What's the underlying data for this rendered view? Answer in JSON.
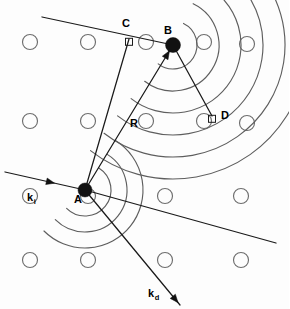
{
  "figure": {
    "kind": "scattering-path-difference-diagram",
    "width": 289,
    "height": 309,
    "background_color": "#fdfdfd",
    "ink_color": "#1a1a1a",
    "arc_color": "#5e5e5e",
    "lattice_color": "#6e6e6e"
  },
  "labels": [
    {
      "name": "label-A",
      "text": "A",
      "x": 74,
      "y": 203,
      "sub": ""
    },
    {
      "name": "label-B",
      "text": "B",
      "x": 164,
      "y": 34,
      "sub": ""
    },
    {
      "name": "label-C",
      "text": "C",
      "x": 122,
      "y": 27,
      "sub": ""
    },
    {
      "name": "label-D",
      "text": "D",
      "x": 221,
      "y": 119,
      "sub": ""
    },
    {
      "name": "label-R",
      "text": "R",
      "x": 130,
      "y": 127,
      "sub": ""
    },
    {
      "name": "label-ki",
      "text": "k",
      "x": 27,
      "y": 201,
      "sub": "i"
    },
    {
      "name": "label-kd",
      "text": "k",
      "x": 148,
      "y": 297,
      "sub": "d"
    }
  ],
  "scatterers": [
    {
      "name": "atom-A",
      "label": "A",
      "x": 85,
      "y": 190,
      "r": 7.0
    },
    {
      "name": "atom-B",
      "label": "B",
      "x": 173,
      "y": 45,
      "r": 7.5
    }
  ],
  "vertices": {
    "C": {
      "x": 129,
      "y": 39
    },
    "D": {
      "x": 212,
      "y": 116
    }
  },
  "vectors": [
    {
      "name": "incident-wavevector-ki",
      "label": "k_i",
      "from_x": 5,
      "from_y": 172,
      "to_x": 85,
      "to_y": 190,
      "arrow_at": 0.62
    },
    {
      "name": "diffracted-wavevector-kd",
      "label": "k_d",
      "from_x": 85,
      "from_y": 190,
      "to_x": 180,
      "to_y": 305,
      "arrow_at": 0.98
    },
    {
      "name": "position-vector-R",
      "label": "R",
      "from_x": 85,
      "from_y": 190,
      "to_x": 173,
      "to_y": 45,
      "arrow_at": 0.96
    }
  ],
  "rays": [
    {
      "name": "incident-ray-upper",
      "x1": 42,
      "y1": 17,
      "x2": 173,
      "y2": 45
    },
    {
      "name": "ray-A-to-C",
      "x1": 85,
      "y1": 190,
      "x2": 129,
      "y2": 39
    },
    {
      "name": "ray-B-to-D",
      "x1": 173,
      "y1": 45,
      "x2": 212,
      "y2": 116
    },
    {
      "name": "diffracted-ray-through-D",
      "x1": 85,
      "y1": 190,
      "x2": 276,
      "y2": 243
    }
  ],
  "right_angles": [
    {
      "name": "right-angle-at-C",
      "x": 129,
      "y": 39,
      "size": 7
    },
    {
      "name": "right-angle-at-D",
      "x": 212,
      "y": 116,
      "size": 7
    }
  ],
  "wavefronts": {
    "from_A": {
      "name": "wavefront-arcs-A",
      "center_x": 85,
      "center_y": 190,
      "radii": [
        26,
        42,
        58
      ],
      "start_deg": -58,
      "end_deg": 135
    },
    "from_B": {
      "name": "wavefront-arcs-B",
      "center_x": 173,
      "center_y": 45,
      "radii": [
        24,
        46,
        68,
        90,
        112,
        134
      ],
      "start_deg": -64,
      "end_deg": 128
    }
  },
  "lattice": {
    "name": "lattice-circles",
    "radius": 7.5,
    "positions": [
      {
        "x": 30,
        "y": 42
      },
      {
        "x": 88,
        "y": 42
      },
      {
        "x": 146,
        "y": 42
      },
      {
        "x": 204,
        "y": 42
      },
      {
        "x": 247,
        "y": 44
      },
      {
        "x": 30,
        "y": 121
      },
      {
        "x": 88,
        "y": 121
      },
      {
        "x": 146,
        "y": 121
      },
      {
        "x": 204,
        "y": 121
      },
      {
        "x": 247,
        "y": 123
      },
      {
        "x": 30,
        "y": 196
      },
      {
        "x": 88,
        "y": 196
      },
      {
        "x": 165,
        "y": 196
      },
      {
        "x": 241,
        "y": 196
      },
      {
        "x": 30,
        "y": 260
      },
      {
        "x": 88,
        "y": 260
      },
      {
        "x": 165,
        "y": 260
      },
      {
        "x": 241,
        "y": 260
      }
    ]
  },
  "chart_data": {
    "type": "diagram",
    "annotations": [
      "A",
      "B",
      "C",
      "D",
      "R",
      "k_i",
      "k_d"
    ],
    "xlabel": "",
    "ylabel": "",
    "grid": false,
    "legend": "none"
  }
}
